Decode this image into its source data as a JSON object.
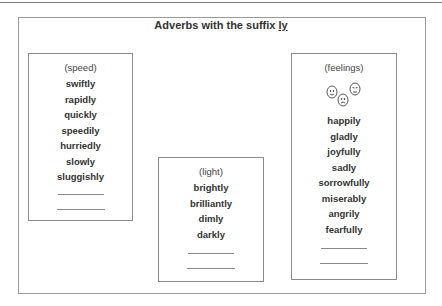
{
  "title": {
    "prefix": "Adverbs with the suffix ",
    "suffix": "ly"
  },
  "boxes": {
    "speed": {
      "category": "(speed)",
      "words": [
        "swiftly",
        "rapidly",
        "quickly",
        "speedily",
        "hurriedly",
        "slowly",
        "sluggishly"
      ],
      "blanks": 2
    },
    "light": {
      "category": "(light)",
      "words": [
        "brightly",
        "brilliantly",
        "dimly",
        "darkly"
      ],
      "blanks": 2
    },
    "feelings": {
      "category": "(feelings)",
      "icon": "faces-icon",
      "words": [
        "happily",
        "gladly",
        "joyfully",
        "sadly",
        "sorrowfully",
        "miserably",
        "angrily",
        "fearfully"
      ],
      "blanks": 2
    }
  }
}
